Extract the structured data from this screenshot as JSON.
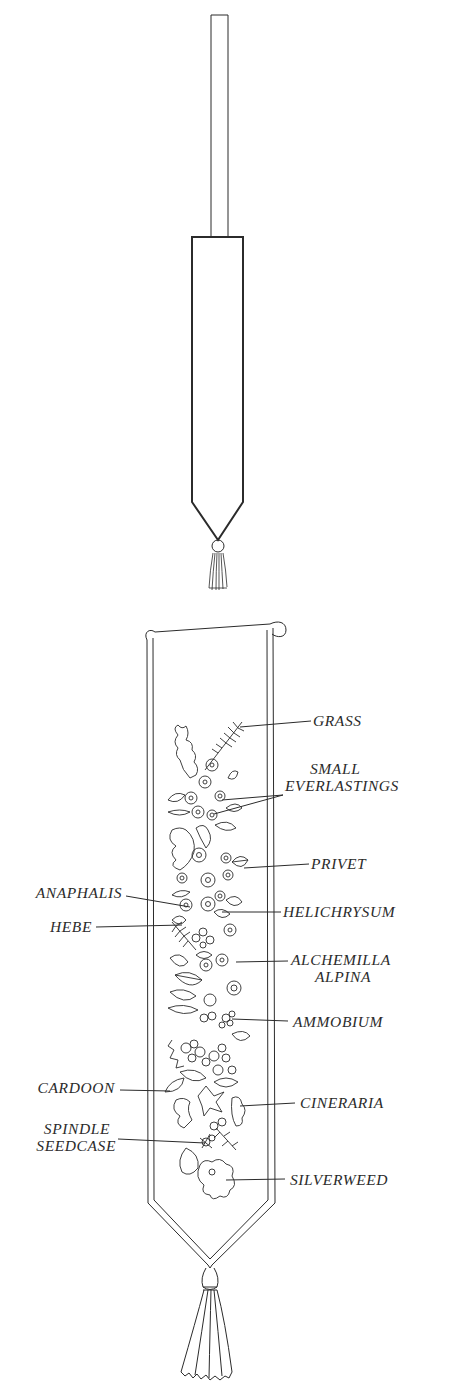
{
  "figure": {
    "upper_diagram": {
      "description": "Bell-pull banner outline with rod and tassel",
      "rod": {
        "x": 211,
        "y": 15,
        "w": 17,
        "h": 222
      },
      "banner": {
        "x": 192,
        "y": 237,
        "w": 51,
        "body_bottom": 502,
        "point_y": 540
      },
      "tassel": {
        "cx": 218,
        "knob_y": 546,
        "bottom_y": 590
      }
    },
    "lower_diagram": {
      "description": "Embroidered/pressed flower bell-pull with labelled plant material",
      "labels": {
        "right": [
          {
            "id": "grass",
            "lines": [
              "GRASS"
            ],
            "x": 313,
            "y": 712,
            "leader_from": [
              311,
              721
            ],
            "leader_to": [
              240,
              727
            ]
          },
          {
            "id": "small-everlastings",
            "lines": [
              "SMALL",
              "EVERLASTINGS"
            ],
            "x": 285,
            "y": 760,
            "leader_from": [
              283,
              795
            ],
            "leader_to": [
              222,
              800
            ]
          },
          {
            "id": "privet",
            "lines": [
              "PRIVET"
            ],
            "x": 311,
            "y": 855,
            "leader_from": [
              309,
              864
            ],
            "leader_to": [
              244,
              868
            ]
          },
          {
            "id": "helichrysum",
            "lines": [
              "HELICHRYSUM"
            ],
            "x": 283,
            "y": 903,
            "leader_from": [
              281,
              912
            ],
            "leader_to": [
              222,
              912
            ]
          },
          {
            "id": "alchemilla-alpina",
            "lines": [
              "ALCHEMILLA",
              "ALPINA"
            ],
            "x": 291,
            "y": 951,
            "leader_from": [
              288,
              961
            ],
            "leader_to": [
              236,
              962
            ]
          },
          {
            "id": "ammobium",
            "lines": [
              "AMMOBIUM"
            ],
            "x": 293,
            "y": 1013,
            "leader_from": [
              288,
              1021
            ],
            "leader_to": [
              232,
              1019
            ]
          },
          {
            "id": "cineraria",
            "lines": [
              "CINERARIA"
            ],
            "x": 300,
            "y": 1094,
            "leader_from": [
              295,
              1103
            ],
            "leader_to": [
              240,
              1106
            ]
          },
          {
            "id": "silverweed",
            "lines": [
              "SILVERWEED"
            ],
            "x": 290,
            "y": 1171,
            "leader_from": [
              285,
              1179
            ],
            "leader_to": [
              226,
              1180
            ]
          }
        ],
        "left": [
          {
            "id": "anaphalis",
            "lines": [
              "ANAPHALIS"
            ],
            "right": 122,
            "y": 884,
            "leader_from": [
              126,
              896
            ],
            "leader_to": [
              190,
              907
            ]
          },
          {
            "id": "hebe",
            "lines": [
              "HEBE"
            ],
            "right": 92,
            "y": 918,
            "leader_from": [
              96,
              927
            ],
            "leader_to": [
              182,
              925
            ]
          },
          {
            "id": "cardoon",
            "lines": [
              "CARDOON"
            ],
            "right": 115,
            "y": 1079,
            "leader_from": [
              120,
              1090
            ],
            "leader_to": [
              170,
              1091
            ]
          },
          {
            "id": "spindle-seedcase",
            "lines": [
              "SPINDLE",
              "SEEDCASE"
            ],
            "right": 116,
            "y": 1120,
            "leader_from": [
              118,
              1139
            ],
            "leader_to": [
              205,
              1143
            ]
          }
        ]
      }
    },
    "colors": {
      "ink": "#2b2b2b",
      "paper": "#ffffff"
    }
  }
}
